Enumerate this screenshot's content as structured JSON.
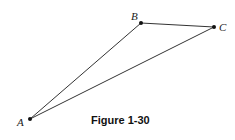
{
  "figure": {
    "caption": "Figure 1-30",
    "points": [
      {
        "name": "A",
        "label": "A",
        "x": 30,
        "y": 119,
        "label_x": 17,
        "label_y": 126
      },
      {
        "name": "B",
        "label": "B",
        "x": 141,
        "y": 23,
        "label_x": 131,
        "label_y": 20
      },
      {
        "name": "C",
        "label": "C",
        "x": 214,
        "y": 27,
        "label_x": 219,
        "label_y": 31
      }
    ],
    "segments": [
      {
        "from": "A",
        "to": "B"
      },
      {
        "from": "B",
        "to": "C"
      },
      {
        "from": "A",
        "to": "C"
      }
    ],
    "colors": {
      "line": "#333333",
      "point": "#111111",
      "text": "#222222"
    }
  }
}
